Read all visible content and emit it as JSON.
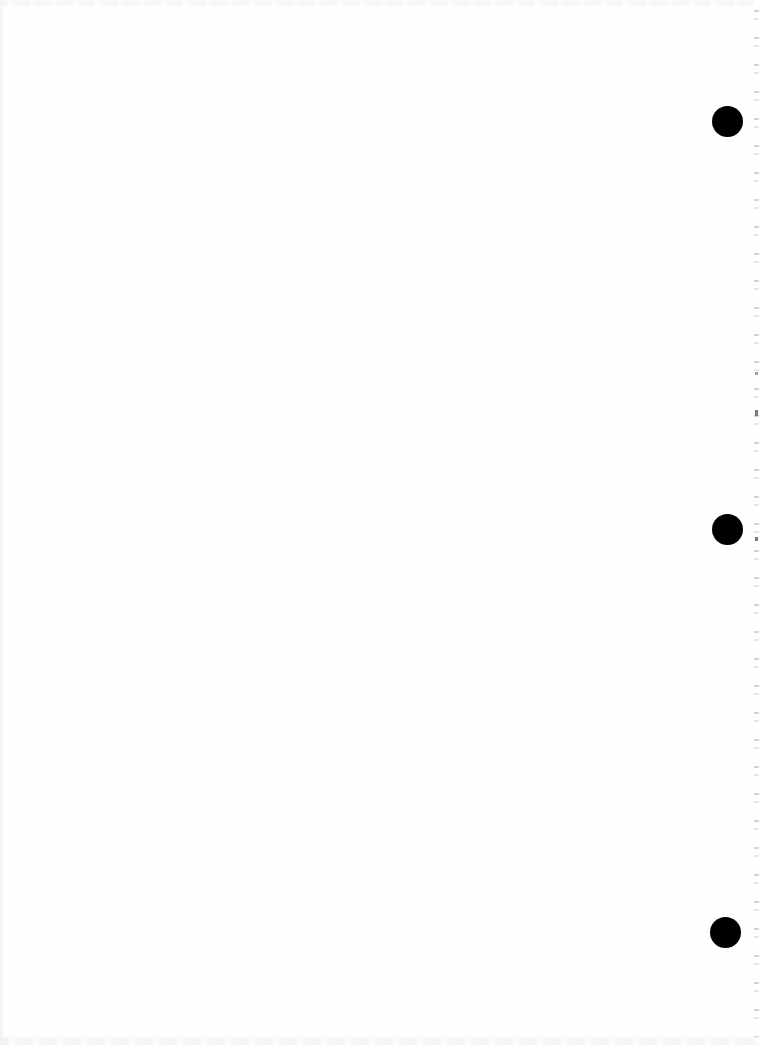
{
  "document": {
    "type": "blank scanned page",
    "text": ""
  },
  "hole_punches": [
    {
      "id": "top",
      "x": 727,
      "y": 122
    },
    {
      "id": "middle",
      "x": 727,
      "y": 529
    },
    {
      "id": "bottom",
      "x": 725,
      "y": 933
    }
  ],
  "colors": {
    "paper": "#fefefe",
    "hole": "#000000",
    "binding_marks": "#7a7a7a"
  }
}
